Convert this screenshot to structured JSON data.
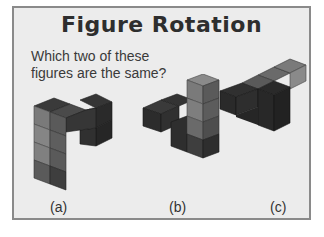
{
  "title": "Figure Rotation",
  "question": "Which two of these figures are the same?",
  "figures": [
    {
      "label": "(a)",
      "icon": "cube-figure-a"
    },
    {
      "label": "(b)",
      "icon": "cube-figure-b"
    },
    {
      "label": "(c)",
      "icon": "cube-figure-c"
    }
  ],
  "colors": {
    "background": "#ececec",
    "border": "#8a8a8a",
    "cube_dark": "#2f2f2f",
    "cube_mid": "#5a5a5a",
    "cube_light": "#8a8a8a"
  }
}
